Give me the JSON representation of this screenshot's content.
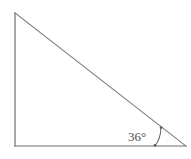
{
  "figure": {
    "type": "right-triangle-with-angle-label",
    "background_color": "#ffffff",
    "stroke_color": "#7a7a7a",
    "leg_stroke_color": "#6e6e6e",
    "text_color": "#4d4d4d",
    "stroke_width": 1.1,
    "vertices": {
      "top_left": {
        "x": 15,
        "y": 13
      },
      "bottom_left": {
        "x": 15,
        "y": 146
      },
      "bottom_right": {
        "x": 186,
        "y": 146
      }
    },
    "labels": {
      "angle_bottom_right": "36°"
    },
    "angle_label_position": {
      "x": 128,
      "y": 141
    },
    "angle_arc": {
      "center": {
        "x": 186,
        "y": 146
      },
      "radius": 31,
      "start_angle_deg": 180,
      "end_angle_deg": 144,
      "endpoint_dot_radius": 1.3
    }
  }
}
